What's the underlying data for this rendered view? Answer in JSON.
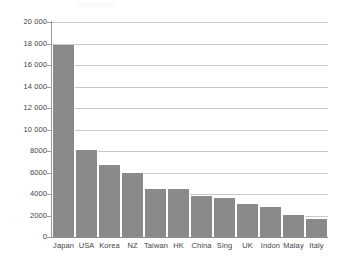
{
  "chart_data": {
    "type": "bar",
    "title": "",
    "subtitle": "",
    "xlabel": "",
    "ylabel": "",
    "categories": [
      "Japan",
      "USA",
      "Korea",
      "NZ",
      "Taiwan",
      "HK",
      "China",
      "Sing",
      "UK",
      "Indon",
      "Malay",
      "Italy"
    ],
    "values": [
      17850,
      8050,
      6700,
      5950,
      4500,
      4450,
      3800,
      3600,
      3050,
      2750,
      2050,
      1650
    ],
    "series": [
      {
        "name": "Value",
        "values": [
          17850,
          8050,
          6700,
          5950,
          4500,
          4450,
          3800,
          3600,
          3050,
          2750,
          2050,
          1650
        ]
      }
    ],
    "ylim": [
      0,
      20000
    ],
    "y_ticks": [
      0,
      2000,
      4000,
      6000,
      8000,
      10000,
      12000,
      14000,
      16000,
      18000,
      20000
    ],
    "y_tick_labels": [
      "0",
      "2000",
      "4000",
      "6000",
      "8000",
      "10 000",
      "12 000",
      "14 000",
      "16 000",
      "18 000",
      "20 000"
    ],
    "grid": true,
    "legend": false,
    "legend_position": "none",
    "bar_color": "#8a8a8a",
    "gridline_color": "#c9c9c9",
    "axis_color": "#9a9a9a",
    "background_color": "#ffffff",
    "annotations": []
  }
}
